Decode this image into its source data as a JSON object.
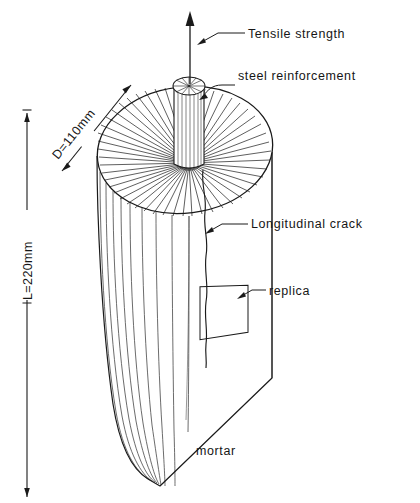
{
  "figure": {
    "background_color": "#ffffff",
    "line_color": "#1a1a1a",
    "specimen_shape": "cylinder"
  },
  "dimensions": {
    "length": {
      "text": "L=220mm",
      "value": 220,
      "unit": "mm",
      "orientation": "vertical"
    },
    "diameter": {
      "text": "D=110mm",
      "value": 110,
      "unit": "mm",
      "orientation": "diagonal"
    }
  },
  "callouts": {
    "tensile_strength": "Tensile strength",
    "steel_reinforcement": "steel reinforcement",
    "longitudinal_crack": "Longitudinal crack",
    "replica": "replica",
    "mortar": "mortar"
  }
}
